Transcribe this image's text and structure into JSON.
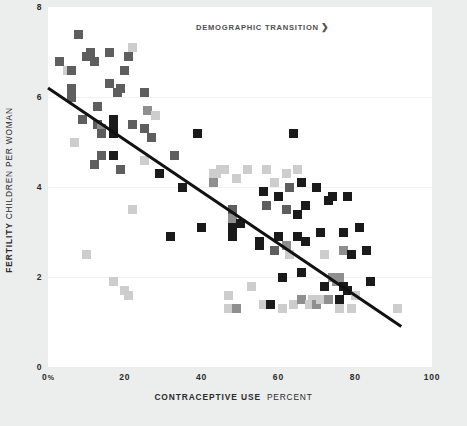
{
  "chart_data": {
    "type": "scatter",
    "title": "",
    "annotation": "DEMOGRAPHIC TRANSITION",
    "annotation_arrow": "❯",
    "xlabel_strong": "CONTRACEPTIVE USE",
    "xlabel_light": "PERCENT",
    "ylabel_strong": "FERTILITY",
    "ylabel_light": "CHILDREN PER WOMAN",
    "xlim": [
      0,
      100
    ],
    "ylim": [
      0,
      8
    ],
    "xticks": [
      {
        "value": 0,
        "label": "0",
        "suffix": "%"
      },
      {
        "value": 20,
        "label": "20",
        "suffix": ""
      },
      {
        "value": 40,
        "label": "40",
        "suffix": ""
      },
      {
        "value": 60,
        "label": "60",
        "suffix": ""
      },
      {
        "value": 80,
        "label": "80",
        "suffix": ""
      },
      {
        "value": 100,
        "label": "100",
        "suffix": ""
      }
    ],
    "yticks": [
      {
        "value": 8,
        "label": "8"
      },
      {
        "value": 6,
        "label": "6"
      },
      {
        "value": 4,
        "label": "4"
      },
      {
        "value": 2,
        "label": "2"
      },
      {
        "value": 0,
        "label": "0"
      }
    ],
    "gridlines_y": [
      6,
      4,
      2
    ],
    "grid": true,
    "legend": "none",
    "colors": {
      "background": "#eceded",
      "panel": "#ffffff",
      "gridline": "#f2f2f2",
      "text": "#2b2b2b",
      "annotation": "#4f4f4f",
      "trendline": "#111111",
      "marker_dark": "#1a1a1a",
      "marker_mid": "#5e5e5e",
      "marker_gray": "#8f8f8f",
      "marker_light": "#cdcdcd"
    },
    "trendline": {
      "x0": 0,
      "y0": 6.2,
      "x1": 92,
      "y1": 0.9
    },
    "marker_shape": "square",
    "marker_size_px": 9,
    "points": [
      {
        "x": 3,
        "y": 6.8,
        "c": "marker_mid"
      },
      {
        "x": 5,
        "y": 6.6,
        "c": "marker_light"
      },
      {
        "x": 6,
        "y": 6.6,
        "c": "marker_mid"
      },
      {
        "x": 8,
        "y": 7.4,
        "c": "marker_mid"
      },
      {
        "x": 6,
        "y": 6.2,
        "c": "marker_mid"
      },
      {
        "x": 6,
        "y": 6.0,
        "c": "marker_mid"
      },
      {
        "x": 7,
        "y": 5.0,
        "c": "marker_light"
      },
      {
        "x": 9,
        "y": 5.5,
        "c": "marker_mid"
      },
      {
        "x": 10,
        "y": 6.9,
        "c": "marker_mid"
      },
      {
        "x": 11,
        "y": 6.9,
        "c": "marker_mid"
      },
      {
        "x": 11,
        "y": 7.0,
        "c": "marker_mid"
      },
      {
        "x": 12,
        "y": 4.5,
        "c": "marker_mid"
      },
      {
        "x": 12,
        "y": 6.8,
        "c": "marker_mid"
      },
      {
        "x": 13,
        "y": 5.8,
        "c": "marker_mid"
      },
      {
        "x": 13,
        "y": 5.4,
        "c": "marker_mid"
      },
      {
        "x": 14,
        "y": 5.3,
        "c": "marker_gray"
      },
      {
        "x": 14,
        "y": 5.2,
        "c": "marker_mid"
      },
      {
        "x": 14,
        "y": 4.7,
        "c": "marker_mid"
      },
      {
        "x": 16,
        "y": 7.0,
        "c": "marker_mid"
      },
      {
        "x": 16,
        "y": 6.3,
        "c": "marker_mid"
      },
      {
        "x": 17,
        "y": 1.9,
        "c": "marker_light"
      },
      {
        "x": 10,
        "y": 2.5,
        "c": "marker_light"
      },
      {
        "x": 17,
        "y": 5.5,
        "c": "marker_dark"
      },
      {
        "x": 17,
        "y": 5.3,
        "c": "marker_dark"
      },
      {
        "x": 17,
        "y": 5.2,
        "c": "marker_dark"
      },
      {
        "x": 17,
        "y": 4.7,
        "c": "marker_dark"
      },
      {
        "x": 18,
        "y": 6.1,
        "c": "marker_mid"
      },
      {
        "x": 19,
        "y": 6.2,
        "c": "marker_mid"
      },
      {
        "x": 19,
        "y": 4.4,
        "c": "marker_mid"
      },
      {
        "x": 20,
        "y": 1.7,
        "c": "marker_light"
      },
      {
        "x": 21,
        "y": 1.6,
        "c": "marker_light"
      },
      {
        "x": 21,
        "y": 6.9,
        "c": "marker_mid"
      },
      {
        "x": 20,
        "y": 6.6,
        "c": "marker_light"
      },
      {
        "x": 20,
        "y": 6.6,
        "c": "marker_mid"
      },
      {
        "x": 22,
        "y": 7.1,
        "c": "marker_light"
      },
      {
        "x": 22,
        "y": 5.4,
        "c": "marker_mid"
      },
      {
        "x": 22,
        "y": 3.5,
        "c": "marker_light"
      },
      {
        "x": 25,
        "y": 6.1,
        "c": "marker_mid"
      },
      {
        "x": 25,
        "y": 5.3,
        "c": "marker_mid"
      },
      {
        "x": 25,
        "y": 4.6,
        "c": "marker_light"
      },
      {
        "x": 26,
        "y": 5.7,
        "c": "marker_gray"
      },
      {
        "x": 27,
        "y": 5.1,
        "c": "marker_mid"
      },
      {
        "x": 28,
        "y": 5.6,
        "c": "marker_light"
      },
      {
        "x": 29,
        "y": 4.3,
        "c": "marker_dark"
      },
      {
        "x": 32,
        "y": 2.9,
        "c": "marker_dark"
      },
      {
        "x": 33,
        "y": 4.7,
        "c": "marker_mid"
      },
      {
        "x": 35,
        "y": 4.0,
        "c": "marker_dark"
      },
      {
        "x": 39,
        "y": 5.2,
        "c": "marker_dark"
      },
      {
        "x": 40,
        "y": 3.1,
        "c": "marker_dark"
      },
      {
        "x": 43,
        "y": 4.3,
        "c": "marker_light"
      },
      {
        "x": 43,
        "y": 4.1,
        "c": "marker_gray"
      },
      {
        "x": 44,
        "y": 4.3,
        "c": "marker_light"
      },
      {
        "x": 45,
        "y": 4.4,
        "c": "marker_light"
      },
      {
        "x": 46,
        "y": 4.4,
        "c": "marker_light"
      },
      {
        "x": 47,
        "y": 1.6,
        "c": "marker_light"
      },
      {
        "x": 47,
        "y": 1.3,
        "c": "marker_light"
      },
      {
        "x": 48,
        "y": 3.5,
        "c": "marker_mid"
      },
      {
        "x": 48,
        "y": 3.3,
        "c": "marker_gray"
      },
      {
        "x": 48,
        "y": 3.1,
        "c": "marker_dark"
      },
      {
        "x": 48,
        "y": 2.9,
        "c": "marker_dark"
      },
      {
        "x": 49,
        "y": 1.3,
        "c": "marker_gray"
      },
      {
        "x": 49,
        "y": 4.2,
        "c": "marker_light"
      },
      {
        "x": 50,
        "y": 3.2,
        "c": "marker_dark"
      },
      {
        "x": 52,
        "y": 4.4,
        "c": "marker_light"
      },
      {
        "x": 53,
        "y": 1.8,
        "c": "marker_light"
      },
      {
        "x": 55,
        "y": 2.8,
        "c": "marker_dark"
      },
      {
        "x": 55,
        "y": 2.7,
        "c": "marker_dark"
      },
      {
        "x": 56,
        "y": 3.9,
        "c": "marker_dark"
      },
      {
        "x": 56,
        "y": 1.4,
        "c": "marker_light"
      },
      {
        "x": 57,
        "y": 4.4,
        "c": "marker_light"
      },
      {
        "x": 57,
        "y": 3.6,
        "c": "marker_mid"
      },
      {
        "x": 58,
        "y": 1.4,
        "c": "marker_dark"
      },
      {
        "x": 59,
        "y": 4.1,
        "c": "marker_light"
      },
      {
        "x": 59,
        "y": 2.6,
        "c": "marker_mid"
      },
      {
        "x": 60,
        "y": 3.8,
        "c": "marker_dark"
      },
      {
        "x": 60,
        "y": 2.9,
        "c": "marker_dark"
      },
      {
        "x": 61,
        "y": 2.0,
        "c": "marker_dark"
      },
      {
        "x": 61,
        "y": 1.3,
        "c": "marker_light"
      },
      {
        "x": 62,
        "y": 4.3,
        "c": "marker_light"
      },
      {
        "x": 62,
        "y": 3.5,
        "c": "marker_mid"
      },
      {
        "x": 62,
        "y": 2.7,
        "c": "marker_gray"
      },
      {
        "x": 63,
        "y": 2.5,
        "c": "marker_light"
      },
      {
        "x": 63,
        "y": 4.0,
        "c": "marker_mid"
      },
      {
        "x": 64,
        "y": 5.2,
        "c": "marker_dark"
      },
      {
        "x": 64,
        "y": 1.4,
        "c": "marker_light"
      },
      {
        "x": 65,
        "y": 4.4,
        "c": "marker_light"
      },
      {
        "x": 65,
        "y": 3.4,
        "c": "marker_dark"
      },
      {
        "x": 65,
        "y": 2.9,
        "c": "marker_dark"
      },
      {
        "x": 66,
        "y": 4.1,
        "c": "marker_dark"
      },
      {
        "x": 66,
        "y": 2.1,
        "c": "marker_dark"
      },
      {
        "x": 66,
        "y": 1.5,
        "c": "marker_gray"
      },
      {
        "x": 67,
        "y": 3.6,
        "c": "marker_dark"
      },
      {
        "x": 67,
        "y": 2.8,
        "c": "marker_dark"
      },
      {
        "x": 68,
        "y": 1.4,
        "c": "marker_light"
      },
      {
        "x": 69,
        "y": 1.5,
        "c": "marker_light"
      },
      {
        "x": 70,
        "y": 4.0,
        "c": "marker_dark"
      },
      {
        "x": 70,
        "y": 1.4,
        "c": "marker_gray"
      },
      {
        "x": 71,
        "y": 3.0,
        "c": "marker_dark"
      },
      {
        "x": 71,
        "y": 1.5,
        "c": "marker_light"
      },
      {
        "x": 72,
        "y": 1.8,
        "c": "marker_dark"
      },
      {
        "x": 72,
        "y": 2.5,
        "c": "marker_light"
      },
      {
        "x": 73,
        "y": 3.7,
        "c": "marker_dark"
      },
      {
        "x": 73,
        "y": 1.5,
        "c": "marker_gray"
      },
      {
        "x": 74,
        "y": 3.8,
        "c": "marker_dark"
      },
      {
        "x": 74,
        "y": 2.0,
        "c": "marker_gray"
      },
      {
        "x": 75,
        "y": 1.9,
        "c": "marker_gray"
      },
      {
        "x": 75,
        "y": 1.9,
        "c": "marker_gray"
      },
      {
        "x": 76,
        "y": 2.0,
        "c": "marker_gray"
      },
      {
        "x": 76,
        "y": 1.5,
        "c": "marker_dark"
      },
      {
        "x": 76,
        "y": 1.3,
        "c": "marker_light"
      },
      {
        "x": 77,
        "y": 3.0,
        "c": "marker_dark"
      },
      {
        "x": 77,
        "y": 2.6,
        "c": "marker_gray"
      },
      {
        "x": 77,
        "y": 1.8,
        "c": "marker_dark"
      },
      {
        "x": 78,
        "y": 3.8,
        "c": "marker_dark"
      },
      {
        "x": 78,
        "y": 1.7,
        "c": "marker_dark"
      },
      {
        "x": 79,
        "y": 1.3,
        "c": "marker_light"
      },
      {
        "x": 79,
        "y": 2.5,
        "c": "marker_dark"
      },
      {
        "x": 80,
        "y": 1.6,
        "c": "marker_light"
      },
      {
        "x": 81,
        "y": 3.1,
        "c": "marker_dark"
      },
      {
        "x": 83,
        "y": 2.6,
        "c": "marker_dark"
      },
      {
        "x": 84,
        "y": 1.9,
        "c": "marker_dark"
      },
      {
        "x": 91,
        "y": 1.3,
        "c": "marker_light"
      }
    ]
  }
}
